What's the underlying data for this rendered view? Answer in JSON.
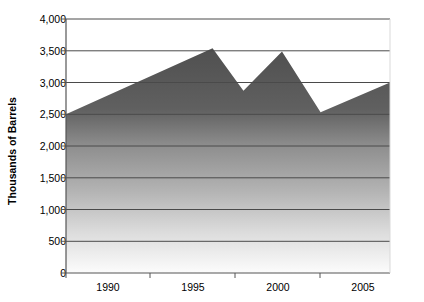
{
  "chart_data": {
    "type": "area",
    "title": "",
    "subtitle": "",
    "xlabel": "",
    "ylabel": "Thousands of Barrels",
    "ylim": [
      0,
      4000
    ],
    "xlim": [
      1987,
      2008
    ],
    "grid": true,
    "legend": false,
    "y_ticks": [
      0,
      500,
      1000,
      1500,
      2000,
      2500,
      3000,
      3500,
      4000
    ],
    "y_tick_labels": [
      "0",
      "500",
      "1,000",
      "1,500",
      "2,000",
      "2,500",
      "3,000",
      "3,500",
      "4,000"
    ],
    "x_ticks": [
      1990,
      1995,
      2000,
      2005
    ],
    "x_tick_labels": [
      "1990",
      "1995",
      "2000",
      "2005"
    ],
    "x": [
      1987,
      1996.5,
      1998.5,
      2001,
      2003.5,
      2008
    ],
    "values": [
      2500,
      3540,
      2870,
      3490,
      2530,
      3000
    ],
    "series": [
      {
        "name": "Barrels",
        "values": [
          2500,
          3540,
          2870,
          3490,
          2530,
          3000
        ]
      }
    ],
    "annotations": []
  },
  "style": {
    "fill_top_color": "#4f4f4f",
    "fill_bottom_color": "#fbfbfb",
    "gridline_color": "#4a4a4a",
    "axis_color": "#555555",
    "text_color": "#000000",
    "plot_background": "#ffffff"
  }
}
